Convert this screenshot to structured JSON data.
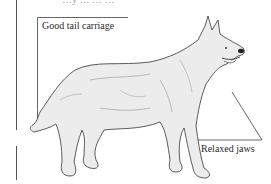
{
  "diagram": {
    "title_fragment": "…y … … …",
    "labels": [
      {
        "id": "tail",
        "text": "Good tail carriage"
      },
      {
        "id": "jaws",
        "text": "Relaxed jaws"
      }
    ],
    "colors": {
      "line": "#4a4a4a",
      "fur": "#e4e4e4",
      "shade": "#b8b8b8",
      "text": "#2a2a2a"
    }
  }
}
